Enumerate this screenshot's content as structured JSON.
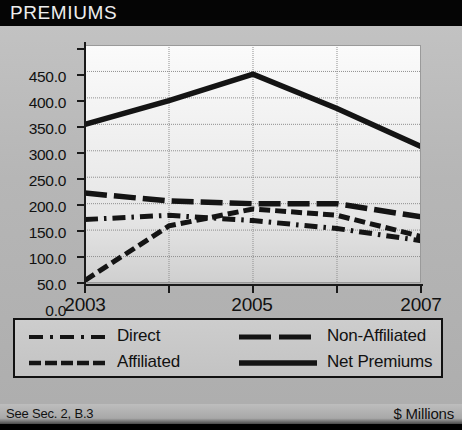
{
  "header": {
    "title": "PREMIUMS"
  },
  "footer": {
    "note": "See Sec. 2, B.3",
    "units": "$ Millions"
  },
  "axis": {
    "y_ticks": [
      "450.0",
      "400.0",
      "350.0",
      "300.0",
      "250.0",
      "200.0",
      "150.0",
      "100.0",
      "50.0",
      "0.0"
    ],
    "x_ticks": [
      "2003",
      "",
      "2005",
      "",
      "2007"
    ],
    "x_labels_shown": [
      "2003",
      "2005",
      "2007"
    ]
  },
  "legend": {
    "items": [
      {
        "label": "Direct",
        "style": "dash-dot",
        "color": "#141414"
      },
      {
        "label": "Non-Affiliated",
        "style": "long-dash",
        "color": "#141414"
      },
      {
        "label": "Affiliated",
        "style": "short-dash",
        "color": "#141414"
      },
      {
        "label": "Net Premiums",
        "style": "solid",
        "color": "#141414"
      }
    ]
  },
  "chart_data": {
    "type": "line",
    "title": "PREMIUMS",
    "xlabel": "",
    "ylabel": "$ Millions",
    "x": [
      2003,
      2004,
      2005,
      2006,
      2007
    ],
    "categories": [
      "2003",
      "2004",
      "2005",
      "2006",
      "2007"
    ],
    "ylim": [
      0,
      450
    ],
    "ytick_step": 50,
    "grid": true,
    "legend_position": "bottom",
    "units": "$ Millions",
    "series": [
      {
        "name": "Direct",
        "style": "dash-dot",
        "color": "#141414",
        "values": [
          120.0,
          128.0,
          118.0,
          103.0,
          80.0
        ]
      },
      {
        "name": "Non-Affiliated",
        "style": "long-dash",
        "color": "#141414",
        "values": [
          170.0,
          155.0,
          150.0,
          150.0,
          125.0
        ]
      },
      {
        "name": "Affiliated",
        "style": "short-dash",
        "color": "#141414",
        "values": [
          5.0,
          108.0,
          140.0,
          128.0,
          88.0
        ]
      },
      {
        "name": "Net Premiums",
        "style": "solid",
        "color": "#141414",
        "values": [
          300.0,
          345.0,
          395.0,
          330.0,
          258.0
        ]
      }
    ]
  },
  "colors": {
    "header_bg": "#050505",
    "header_text": "#ededed",
    "panel_bg": "#b6b6b6",
    "plot_bg": "#f2f2f2",
    "ink": "#141414",
    "grid": "#8f8f8f"
  }
}
